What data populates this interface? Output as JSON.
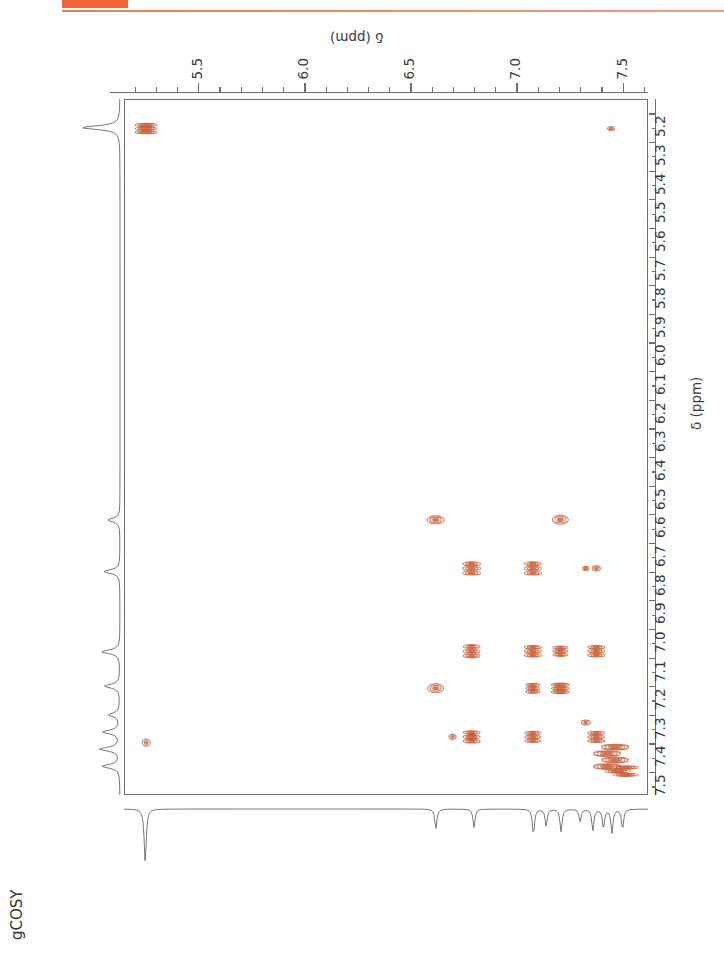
{
  "decor": {
    "block_color": "#f4653c",
    "rule_color": "#f07a52"
  },
  "experiment": {
    "label": "gCOSY"
  },
  "axes": {
    "top": {
      "title": "δ (ppm)",
      "major_ticks": [
        "5.5",
        "6.0",
        "6.5",
        "7.0",
        "7.5"
      ],
      "range": [
        5.15,
        7.62
      ]
    },
    "right": {
      "title": "δ (ppm)",
      "major_ticks": [
        "5.2",
        "5.3",
        "5.4",
        "5.5",
        "5.6",
        "5.7",
        "5.8",
        "5.9",
        "6.0",
        "6.1",
        "6.2",
        "6.3",
        "6.4",
        "6.5",
        "6.6",
        "6.7",
        "6.8",
        "6.9",
        "7.0",
        "7.1",
        "7.2",
        "7.3",
        "7.4",
        "7.5"
      ],
      "range": [
        5.15,
        7.58
      ]
    }
  },
  "chart_data": {
    "type": "scatter",
    "title": "gCOSY",
    "xlabel": "δ (ppm)",
    "ylabel": "δ (ppm)",
    "xlim": [
      5.15,
      7.62
    ],
    "ylim": [
      5.15,
      7.58
    ],
    "x_inverted": false,
    "y_inverted": false,
    "grid": false,
    "legend": "none",
    "peak_color": "#c0552e",
    "peak_fill": "#d4704a",
    "diagonal_peaks": [
      {
        "x": 5.25,
        "y": 5.25,
        "w": 22,
        "h": 11,
        "intensity": "strong",
        "label": "H-5.25 diagonal"
      },
      {
        "x": 6.62,
        "y": 6.62,
        "w": 17,
        "h": 8,
        "intensity": "medium",
        "label": "H-6.62 diagonal"
      },
      {
        "x": 6.79,
        "y": 6.79,
        "w": 18,
        "h": 14,
        "intensity": "medium",
        "label": "H-6.79 diagonal"
      },
      {
        "x": 7.08,
        "y": 7.08,
        "w": 17,
        "h": 12,
        "intensity": "medium",
        "label": "H-7.08 diagonal"
      },
      {
        "x": 7.21,
        "y": 7.21,
        "w": 18,
        "h": 11,
        "intensity": "strong",
        "label": "H-7.21 diagonal"
      },
      {
        "x": 7.33,
        "y": 7.33,
        "w": 9,
        "h": 5,
        "intensity": "weak",
        "label": "H-7.33 diagonal"
      },
      {
        "x": 7.38,
        "y": 7.38,
        "w": 17,
        "h": 12,
        "intensity": "medium",
        "label": "H-7.38 diagonal"
      },
      {
        "x": 7.45,
        "y": 7.45,
        "w": 34,
        "h": 26,
        "intensity": "strong",
        "label": "H-7.45 cluster diagonal"
      },
      {
        "x": 7.5,
        "y": 7.5,
        "w": 32,
        "h": 11,
        "intensity": "strong",
        "label": "H-7.50 cluster diagonal"
      }
    ],
    "cross_peaks": [
      {
        "x": 6.62,
        "y": 7.21,
        "w": 16,
        "h": 9,
        "intensity": "medium",
        "label": "6.62/7.21"
      },
      {
        "x": 7.21,
        "y": 6.62,
        "w": 16,
        "h": 9,
        "intensity": "medium",
        "label": "7.21/6.62"
      },
      {
        "x": 6.79,
        "y": 7.08,
        "w": 17,
        "h": 14,
        "intensity": "medium",
        "label": "6.79/7.08"
      },
      {
        "x": 7.08,
        "y": 6.79,
        "w": 17,
        "h": 14,
        "intensity": "medium",
        "label": "7.08/6.79"
      },
      {
        "x": 6.79,
        "y": 7.38,
        "w": 17,
        "h": 13,
        "intensity": "medium",
        "label": "6.79/7.38"
      },
      {
        "x": 7.38,
        "y": 6.79,
        "w": 8,
        "h": 5,
        "intensity": "weak",
        "label": "7.38/6.79"
      },
      {
        "x": 7.08,
        "y": 7.21,
        "w": 14,
        "h": 10,
        "intensity": "medium",
        "label": "7.08/7.21"
      },
      {
        "x": 7.21,
        "y": 7.08,
        "w": 15,
        "h": 11,
        "intensity": "medium",
        "label": "7.21/7.08"
      },
      {
        "x": 6.79,
        "y": 7.38,
        "w": 9,
        "h": 6,
        "intensity": "weak",
        "label": "6.79/7.38 minor"
      },
      {
        "x": 7.38,
        "y": 7.08,
        "w": 17,
        "h": 12,
        "intensity": "medium",
        "label": "7.38/7.08"
      },
      {
        "x": 7.08,
        "y": 7.38,
        "w": 16,
        "h": 12,
        "intensity": "medium",
        "label": "7.08/7.38"
      },
      {
        "x": 7.45,
        "y": 5.25,
        "w": 7,
        "h": 4,
        "intensity": "weak",
        "label": "7.45/5.25"
      },
      {
        "x": 5.25,
        "y": 7.4,
        "w": 8,
        "h": 7,
        "intensity": "weak",
        "label": "5.25/7.40"
      },
      {
        "x": 7.33,
        "y": 6.79,
        "w": 6,
        "h": 4,
        "intensity": "weak",
        "label": "7.33/6.79"
      },
      {
        "x": 6.7,
        "y": 7.38,
        "w": 7,
        "h": 5,
        "intensity": "weak",
        "label": "6.70/7.38"
      }
    ],
    "f2_projection_peaks": [
      {
        "ppm": 5.25,
        "height": 0.95
      },
      {
        "ppm": 6.62,
        "height": 0.35
      },
      {
        "ppm": 6.8,
        "height": 0.33
      },
      {
        "ppm": 7.08,
        "height": 0.45
      },
      {
        "ppm": 7.14,
        "height": 0.3
      },
      {
        "ppm": 7.21,
        "height": 0.4
      },
      {
        "ppm": 7.3,
        "height": 0.22
      },
      {
        "ppm": 7.36,
        "height": 0.38
      },
      {
        "ppm": 7.41,
        "height": 0.34
      },
      {
        "ppm": 7.45,
        "height": 0.42
      },
      {
        "ppm": 7.5,
        "height": 0.36
      }
    ],
    "f1_projection_peaks": [
      {
        "ppm": 5.25,
        "height": 0.95
      },
      {
        "ppm": 6.62,
        "height": 0.3
      },
      {
        "ppm": 6.8,
        "height": 0.4
      },
      {
        "ppm": 7.08,
        "height": 0.45
      },
      {
        "ppm": 7.2,
        "height": 0.38
      },
      {
        "ppm": 7.3,
        "height": 0.28
      },
      {
        "ppm": 7.36,
        "height": 0.42
      },
      {
        "ppm": 7.42,
        "height": 0.5
      },
      {
        "ppm": 7.48,
        "height": 0.44
      }
    ]
  }
}
